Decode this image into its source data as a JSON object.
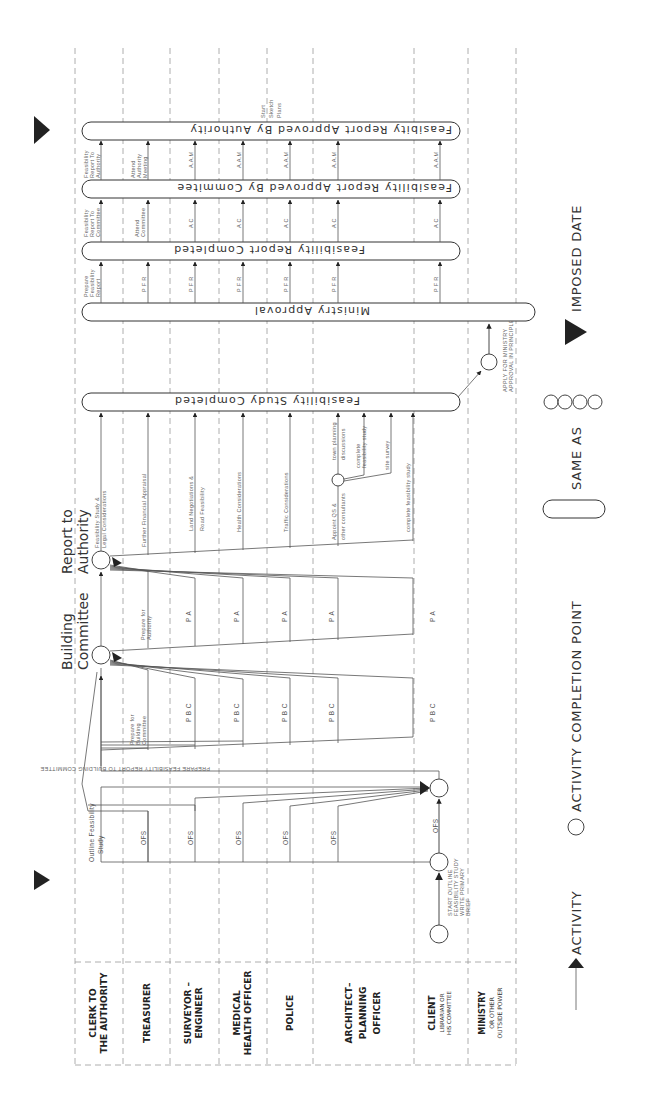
{
  "lanes": [
    {
      "line1": "CLERK  TO",
      "line2": "THE AUTHORITY"
    },
    {
      "line1": "TREASURER",
      "line2": ""
    },
    {
      "line1": "SURVEYOR –",
      "line2": "ENGINEER"
    },
    {
      "line1": "MEDICAL",
      "line2": "HEALTH OFFICER"
    },
    {
      "line1": "POLICE",
      "line2": ""
    },
    {
      "line1": "ARCHITECT–",
      "line2": "PLANNING",
      "line3": "OFFICER"
    },
    {
      "line1": "CLIENT",
      "line2": "LIBRARIAN  OR",
      "line3": "HIS COMMITTEE"
    },
    {
      "line1": "MINISTRY",
      "line2": "OR  OTHER",
      "line3": "OUTSIDE POWER"
    }
  ],
  "milestones": {
    "building_committee_1": "Building",
    "building_committee_2": "Committee",
    "report_authority_1": "Report  to",
    "report_authority_2": "Authority"
  },
  "bars": {
    "feasibility_study_completed": "Feasibility   Study   Completed",
    "ministry_approval": "Ministry    Approval",
    "feasibility_report_completed": "Feasibility    Report    Completed",
    "approved_by_committee": "Feasibility  Report  Approved  By  Commitee",
    "approved_by_authority": "Feasibity  Report  Approved  By  Authority"
  },
  "activities": {
    "start_outline": [
      "START  OUTLINE",
      "FEASIBILITY  STUDY",
      "WRITE  PRIMARY",
      "BRIEF"
    ],
    "ofs": "OFS",
    "outline_feasibility_1": "Outline  Feasibility",
    "outline_feasibility_2": "Study",
    "prepare_report_bc": "PREPARE   FEASIBILITY   REPORT  TO  BUILDING  COMMITTEE",
    "prepare_bc": [
      "Prepare  for",
      "Building",
      "Committee"
    ],
    "pbc": "P B C",
    "prepare_authority": [
      "Prepare  for",
      "Authority"
    ],
    "pa": "P A",
    "feasibility_legal": [
      "Feasibility  Study  &",
      "Legal  Considerations"
    ],
    "further_financial": "Further  Financial  Appraisal",
    "land_negotiations": [
      "Land   Negotiations   &",
      "Road  Feasibility"
    ],
    "health": "Health   Considerations",
    "traffic": "Traffic   Considerations",
    "appoint_qs": [
      "Appoint  QS  &",
      "other consultants"
    ],
    "town_planning": [
      "town  planning",
      "discussions"
    ],
    "complete_study_small": [
      "complete",
      "feasibility study"
    ],
    "site_survey": "site  survey",
    "complete_study": "complete  feasibility  study",
    "apply_ministry": [
      "APPLY  FOR  MINISTRY",
      "APPROVAL  IN  PRINCIPLE"
    ],
    "prepare_report": [
      "Prepare",
      "Feasibility",
      "Report"
    ],
    "pfr": "P F R",
    "report_to_committee": [
      "Feasibility",
      "Report  To",
      "Committee"
    ],
    "attend_committee": [
      "Attend",
      "Committee"
    ],
    "ac": "A C",
    "report_to_authority": [
      "Feasibility",
      "Report  To",
      "Authority"
    ],
    "attend_authority": [
      "Attend",
      "Authority",
      "Meeting"
    ],
    "aam": "A.A.M",
    "start_sketch": [
      "Start",
      "Sketch",
      "Plans"
    ]
  },
  "legend": {
    "activity": "ACTIVITY",
    "completion_point": "ACTIVITY  COMPLETION  POINT",
    "same_as": "SAME  AS",
    "imposed_date": "IMPOSED  DATE"
  }
}
